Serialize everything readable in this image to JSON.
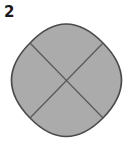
{
  "figure": {
    "label": "2",
    "shape": "four-lobed circle divided by X",
    "lobes": 4,
    "colors": {
      "fill": "#ababab",
      "outline": "#4a4a4a",
      "divider": "#5a5a5a",
      "background": "#ffffff"
    }
  }
}
